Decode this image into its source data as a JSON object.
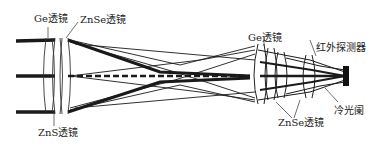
{
  "diagram": {
    "type": "optical-ray-trace",
    "labels": {
      "ge_lens_front": "Ge透镜",
      "znse_lens_front": "ZnSe透镜",
      "zns_lens": "ZnS透镜",
      "ge_lens_rear": "Ge透镜",
      "ir_detector": "红外探测器",
      "znse_lens_rear": "ZnSe透镜",
      "cold_stop": "冷光阑"
    },
    "colors": {
      "background": "#ffffff",
      "ray": "#1a1a1a",
      "lens": "#333333",
      "text": "#222222"
    }
  }
}
